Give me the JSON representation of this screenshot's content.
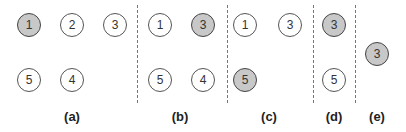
{
  "figure": {
    "panels": [
      {
        "label": "(a)",
        "label_x": 72,
        "nodes": [
          {
            "id": "1",
            "x": 29,
            "y": 25,
            "filled": true
          },
          {
            "id": "2",
            "x": 72,
            "y": 25,
            "filled": false
          },
          {
            "id": "3",
            "x": 115,
            "y": 25,
            "filled": false
          },
          {
            "id": "5",
            "x": 29,
            "y": 80,
            "filled": false
          },
          {
            "id": "4",
            "x": 72,
            "y": 80,
            "filled": false
          }
        ]
      },
      {
        "label": "(b)",
        "label_x": 180,
        "nodes": [
          {
            "id": "1",
            "x": 160,
            "y": 25,
            "filled": false
          },
          {
            "id": "3",
            "x": 203,
            "y": 25,
            "filled": true
          },
          {
            "id": "5",
            "x": 160,
            "y": 80,
            "filled": false
          },
          {
            "id": "4",
            "x": 203,
            "y": 80,
            "filled": false
          }
        ]
      },
      {
        "label": "(c)",
        "label_x": 269,
        "nodes": [
          {
            "id": "1",
            "x": 245,
            "y": 25,
            "filled": false
          },
          {
            "id": "3",
            "x": 290,
            "y": 25,
            "filled": false
          },
          {
            "id": "5",
            "x": 245,
            "y": 80,
            "filled": true
          }
        ]
      },
      {
        "label": "(d)",
        "label_x": 334,
        "nodes": [
          {
            "id": "3",
            "x": 334,
            "y": 25,
            "filled": true
          },
          {
            "id": "5",
            "x": 334,
            "y": 80,
            "filled": false
          }
        ]
      },
      {
        "label": "(e)",
        "label_x": 377,
        "nodes": [
          {
            "id": "3",
            "x": 377,
            "y": 54,
            "filled": true
          }
        ]
      }
    ],
    "dividers_x": [
      137,
      227,
      313,
      355
    ],
    "colors": {
      "filled_node": "#c8c8c8",
      "empty_node": "#ffffff",
      "node_border": "#555555",
      "divider": "#777777"
    }
  }
}
